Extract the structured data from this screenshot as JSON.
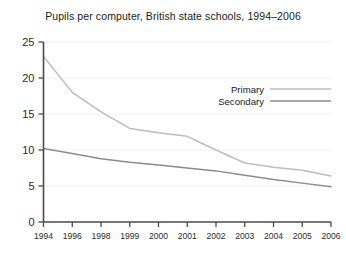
{
  "chart_data": {
    "type": "line",
    "title": "Pupils per computer, British state schools, 1994–2006",
    "xlabel": "",
    "ylabel": "",
    "categories": [
      "1994",
      "1996",
      "1998",
      "1999",
      "2000",
      "2001",
      "2002",
      "2003",
      "2004",
      "2005",
      "2006"
    ],
    "series": [
      {
        "name": "Primary",
        "color": "#bdbdbd",
        "values": [
          23.0,
          18.0,
          15.3,
          13.0,
          12.4,
          11.9,
          10.0,
          8.2,
          7.6,
          7.2,
          6.4
        ]
      },
      {
        "name": "Secondary",
        "color": "#8c8c8c",
        "values": [
          10.2,
          9.5,
          8.8,
          8.3,
          7.9,
          7.5,
          7.1,
          6.5,
          5.9,
          5.4,
          4.9
        ]
      }
    ],
    "ylim": [
      0,
      25
    ],
    "yticks": [
      0,
      5,
      10,
      15,
      20,
      25
    ],
    "ytick_labels": [
      "0",
      "5",
      "10",
      "15",
      "20",
      "25"
    ],
    "grid": true,
    "grid_color": "#ededed",
    "legend_position": "inside-top-right",
    "axis_color": "#4a4a4a",
    "background": "#ffffff"
  },
  "legend": {
    "entries": [
      {
        "label": "Primary"
      },
      {
        "label": "Secondary"
      }
    ]
  }
}
